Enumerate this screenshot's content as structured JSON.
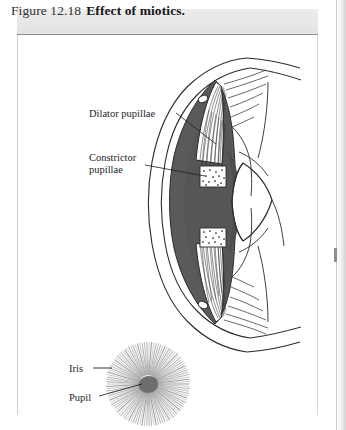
{
  "figure": {
    "caption_number": "Figure 12.18",
    "caption_title": "Effect of miotics.",
    "domain": "anatomical-illustration"
  },
  "labels": {
    "dilator": "Dilator pupillae",
    "constrictor_line1": "Constrictor",
    "constrictor_line2": "pupillae",
    "iris": "Iris",
    "pupil": "Pupil"
  },
  "colors": {
    "iris_mass": "#5a5a5a",
    "iris_mass_dark": "#4e4e4e",
    "lens_fill": "#ffffff",
    "outline": "#2a2a2a",
    "caption_bar": "#e9e9e9",
    "caption_rule": "#8c8c8c",
    "inset_stria": "#9a9a9a",
    "pupil_fill": "#6e6e6e",
    "page_background": "#ffffff"
  },
  "structures": [
    "cornea",
    "sclera",
    "anterior-chamber",
    "iris-stroma",
    "dilator-pupillae-muscle",
    "constrictor-pupillae-muscle",
    "ciliary-body",
    "zonular-fibers",
    "lens",
    "canal-of-schlemm-superior",
    "canal-of-schlemm-inferior"
  ],
  "inset": {
    "view": "frontal",
    "iris_striations": 110,
    "pupil_state": "constricted"
  }
}
